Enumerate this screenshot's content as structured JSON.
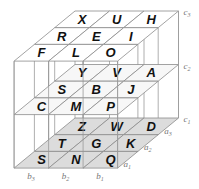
{
  "diagram": {
    "type": "3x3x3 letter cube (layered)",
    "layers": [
      {
        "label": "c3",
        "rows": [
          {
            "row": "a3",
            "cells": [
              "X",
              "U",
              "H"
            ]
          },
          {
            "row": "a2",
            "cells": [
              "R",
              "E",
              "I"
            ]
          },
          {
            "row": "a1",
            "cells": [
              "F",
              "L",
              "O"
            ]
          }
        ]
      },
      {
        "label": "c2",
        "rows": [
          {
            "row": "a3",
            "cells": [
              "Y",
              "V",
              "A"
            ]
          },
          {
            "row": "a2",
            "cells": [
              "S",
              "B",
              "J"
            ]
          },
          {
            "row": "a1",
            "cells": [
              "C",
              "M",
              "P"
            ]
          }
        ]
      },
      {
        "label": "c1",
        "rows": [
          {
            "row": "a3",
            "cells": [
              "Z",
              "W",
              "D"
            ]
          },
          {
            "row": "a2",
            "cells": [
              "T",
              "G",
              "K"
            ]
          },
          {
            "row": "a1",
            "cells": [
              "S",
              "N",
              "Q"
            ]
          }
        ]
      }
    ],
    "column_labels": [
      "b3",
      "b2",
      "b1"
    ],
    "row_labels": [
      "a3",
      "a2",
      "a1"
    ],
    "layer_labels": [
      "c3",
      "c2",
      "c1"
    ],
    "colors": {
      "line": "#8c8c8c",
      "bottom_fill": "#dcdcdc",
      "letter": "#111111",
      "label": "#777777"
    }
  }
}
